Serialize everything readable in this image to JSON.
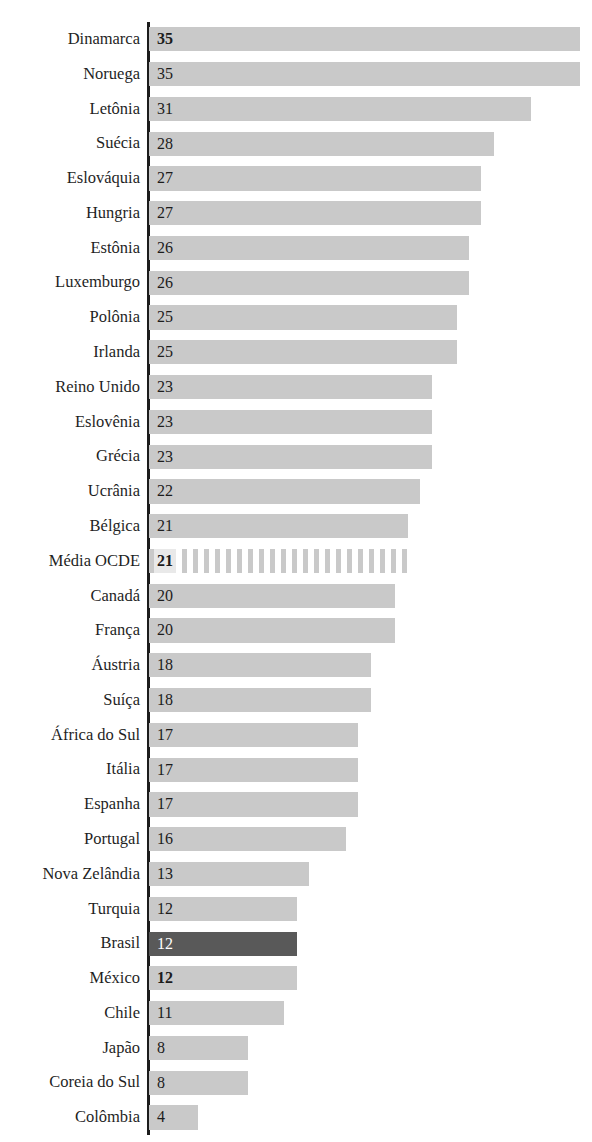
{
  "chart": {
    "title": "",
    "axis_name": "category-axis"
  },
  "chart_data": {
    "type": "bar",
    "orientation": "horizontal",
    "title": "",
    "xlabel": "",
    "ylabel": "",
    "xlim": [
      0,
      35
    ],
    "grid": false,
    "legend": false,
    "highlight_category": "Brasil",
    "reference_category": "Média OCDE",
    "colors": {
      "bar": "#c9c9c9",
      "highlight": "#595959",
      "hatched": "#c9c9c9",
      "axis": "#1c1c1c",
      "text": "#1c1c1c",
      "highlight_text": "#ffffff"
    },
    "categories": [
      "Dinamarca",
      "Noruega",
      "Letônia",
      "Suécia",
      "Eslováquia",
      "Hungria",
      "Estônia",
      "Luxemburgo",
      "Polônia",
      "Irlanda",
      "Reino Unido",
      "Eslovênia",
      "Grécia",
      "Ucrânia",
      "Bélgica",
      "Média OCDE",
      "Canadá",
      "França",
      "Áustria",
      "Suíça",
      "África do Sul",
      "Itália",
      "Espanha",
      "Portugal",
      "Nova Zelândia",
      "Turquia",
      "Brasil",
      "México",
      "Chile",
      "Japão",
      "Coreia do Sul",
      "Colômbia"
    ],
    "values": [
      35,
      35,
      31,
      28,
      27,
      27,
      26,
      26,
      25,
      25,
      23,
      23,
      23,
      22,
      21,
      21,
      20,
      20,
      18,
      18,
      17,
      17,
      17,
      16,
      13,
      12,
      12,
      12,
      11,
      8,
      8,
      4
    ],
    "bars": [
      {
        "label": "Dinamarca",
        "value": 35,
        "value_text": "35",
        "style": "plain",
        "bold": true,
        "white_text": false
      },
      {
        "label": "Noruega",
        "value": 35,
        "value_text": "35",
        "style": "plain",
        "bold": false,
        "white_text": false
      },
      {
        "label": "Letônia",
        "value": 31,
        "value_text": "31",
        "style": "plain",
        "bold": false,
        "white_text": false
      },
      {
        "label": "Suécia",
        "value": 28,
        "value_text": "28",
        "style": "plain",
        "bold": false,
        "white_text": false
      },
      {
        "label": "Eslováquia",
        "value": 27,
        "value_text": "27",
        "style": "plain",
        "bold": false,
        "white_text": false
      },
      {
        "label": "Hungria",
        "value": 27,
        "value_text": "27",
        "style": "plain",
        "bold": false,
        "white_text": false
      },
      {
        "label": "Estônia",
        "value": 26,
        "value_text": "26",
        "style": "plain",
        "bold": false,
        "white_text": false
      },
      {
        "label": "Luxemburgo",
        "value": 26,
        "value_text": "26",
        "style": "plain",
        "bold": false,
        "white_text": false
      },
      {
        "label": "Polônia",
        "value": 25,
        "value_text": "25",
        "style": "plain",
        "bold": false,
        "white_text": false
      },
      {
        "label": "Irlanda",
        "value": 25,
        "value_text": "25",
        "style": "plain",
        "bold": false,
        "white_text": false
      },
      {
        "label": "Reino Unido",
        "value": 23,
        "value_text": "23",
        "style": "plain",
        "bold": false,
        "white_text": false
      },
      {
        "label": "Eslovênia",
        "value": 23,
        "value_text": "23",
        "style": "plain",
        "bold": false,
        "white_text": false
      },
      {
        "label": "Grécia",
        "value": 23,
        "value_text": "23",
        "style": "plain",
        "bold": false,
        "white_text": false
      },
      {
        "label": "Ucrânia",
        "value": 22,
        "value_text": "22",
        "style": "plain",
        "bold": false,
        "white_text": false
      },
      {
        "label": "Bélgica",
        "value": 21,
        "value_text": "21",
        "style": "plain",
        "bold": false,
        "white_text": false
      },
      {
        "label": "Média OCDE",
        "value": 21,
        "value_text": "21",
        "style": "hatched",
        "bold": true,
        "white_text": false
      },
      {
        "label": "Canadá",
        "value": 20,
        "value_text": "20",
        "style": "plain",
        "bold": false,
        "white_text": false
      },
      {
        "label": "França",
        "value": 20,
        "value_text": "20",
        "style": "plain",
        "bold": false,
        "white_text": false
      },
      {
        "label": "Áustria",
        "value": 18,
        "value_text": "18",
        "style": "plain",
        "bold": false,
        "white_text": false
      },
      {
        "label": "Suíça",
        "value": 18,
        "value_text": "18",
        "style": "plain",
        "bold": false,
        "white_text": false
      },
      {
        "label": "África do Sul",
        "value": 17,
        "value_text": "17",
        "style": "plain",
        "bold": false,
        "white_text": false
      },
      {
        "label": "Itália",
        "value": 17,
        "value_text": "17",
        "style": "plain",
        "bold": false,
        "white_text": false
      },
      {
        "label": "Espanha",
        "value": 17,
        "value_text": "17",
        "style": "plain",
        "bold": false,
        "white_text": false
      },
      {
        "label": "Portugal",
        "value": 16,
        "value_text": "16",
        "style": "plain",
        "bold": false,
        "white_text": false
      },
      {
        "label": "Nova Zelândia",
        "value": 13,
        "value_text": "13",
        "style": "plain",
        "bold": false,
        "white_text": false
      },
      {
        "label": "Turquia",
        "value": 12,
        "value_text": "12",
        "style": "plain",
        "bold": false,
        "white_text": false
      },
      {
        "label": "Brasil",
        "value": 12,
        "value_text": "12",
        "style": "highlight",
        "bold": false,
        "white_text": true
      },
      {
        "label": "México",
        "value": 12,
        "value_text": "12",
        "style": "plain",
        "bold": true,
        "white_text": false
      },
      {
        "label": "Chile",
        "value": 11,
        "value_text": "11",
        "style": "plain",
        "bold": false,
        "white_text": false
      },
      {
        "label": "Japão",
        "value": 8,
        "value_text": "8",
        "style": "plain",
        "bold": false,
        "white_text": false
      },
      {
        "label": "Coreia do Sul",
        "value": 8,
        "value_text": "8",
        "style": "plain",
        "bold": false,
        "white_text": false
      },
      {
        "label": "Colômbia",
        "value": 4,
        "value_text": "4",
        "style": "plain",
        "bold": false,
        "white_text": false
      }
    ]
  }
}
